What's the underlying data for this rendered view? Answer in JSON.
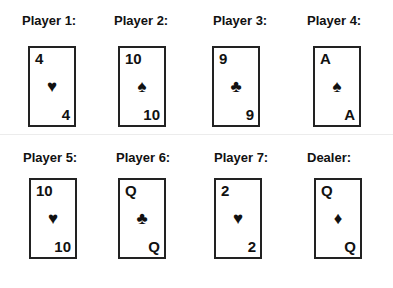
{
  "hands": [
    {
      "label": "Player 1:",
      "rank": "4",
      "suit": "♥",
      "suit_name": "hearts"
    },
    {
      "label": "Player 2:",
      "rank": "10",
      "suit": "♠",
      "suit_name": "spades"
    },
    {
      "label": "Player 3:",
      "rank": "9",
      "suit": "♣",
      "suit_name": "clubs"
    },
    {
      "label": "Player 4:",
      "rank": "A",
      "suit": "♠",
      "suit_name": "spades"
    },
    {
      "label": "Player 5:",
      "rank": "10",
      "suit": "♥",
      "suit_name": "hearts"
    },
    {
      "label": "Player 6:",
      "rank": "Q",
      "suit": "♣",
      "suit_name": "clubs"
    },
    {
      "label": "Player 7:",
      "rank": "2",
      "suit": "♥",
      "suit_name": "hearts"
    },
    {
      "label": "Dealer:",
      "rank": "Q",
      "suit": "♦",
      "suit_name": "diamonds"
    }
  ]
}
